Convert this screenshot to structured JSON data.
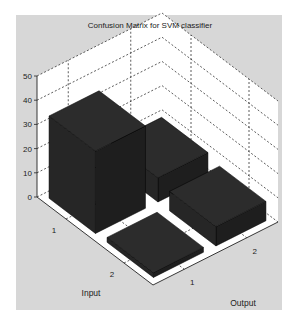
{
  "figure": {
    "background": "#ffffff",
    "panel_color": "#d7d7d7",
    "bar_color": "#1e1e1e"
  },
  "chart_data": {
    "type": "bar3d",
    "title": "Confusion Matrix for SVM classifier",
    "xlabel": "Input",
    "ylabel": "Output",
    "zlabel": "",
    "x_categories": [
      "1",
      "2"
    ],
    "y_categories": [
      "1",
      "2"
    ],
    "z_ticks": [
      0,
      10,
      20,
      30,
      40,
      50
    ],
    "zlim": [
      0,
      50
    ],
    "grid": true,
    "matrix": [
      {
        "input": "1",
        "output": "1",
        "value": 34
      },
      {
        "input": "1",
        "output": "2",
        "value": 10
      },
      {
        "input": "2",
        "output": "1",
        "value": 2
      },
      {
        "input": "2",
        "output": "2",
        "value": 8
      }
    ]
  }
}
